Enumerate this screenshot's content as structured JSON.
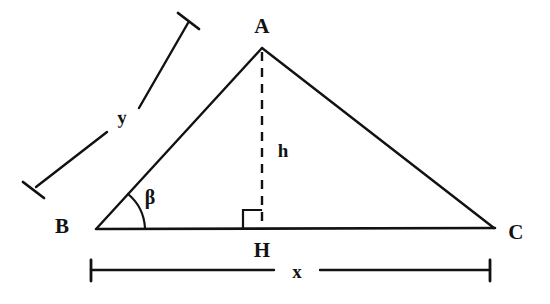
{
  "figure": {
    "background_color": "#ffffff",
    "stroke_color": "#121212",
    "width": 550,
    "height": 304
  },
  "vertices": [
    {
      "name": "A",
      "label": "A",
      "point": {
        "x": 262,
        "y": 48
      },
      "label_pos": {
        "x": 262,
        "y": 26
      }
    },
    {
      "name": "B",
      "label": "B",
      "point": {
        "x": 97,
        "y": 228
      },
      "label_pos": {
        "x": 62,
        "y": 226
      }
    },
    {
      "name": "C",
      "label": "C",
      "point": {
        "x": 494,
        "y": 228
      },
      "label_pos": {
        "x": 516,
        "y": 232
      }
    },
    {
      "name": "H",
      "label": "H",
      "point": {
        "x": 262,
        "y": 228
      },
      "label_pos": {
        "x": 262,
        "y": 250
      }
    }
  ],
  "measures": {
    "height": {
      "label": "h",
      "label_pos": {
        "x": 283,
        "y": 150
      },
      "style": "dashed",
      "from": "A",
      "to": "H"
    },
    "side_y": {
      "label": "y",
      "label_pos": {
        "x": 122,
        "y": 117
      },
      "style": "dimension-line",
      "describes": "BA"
    },
    "base_x": {
      "label": "x",
      "label_pos": {
        "x": 297,
        "y": 271
      },
      "style": "dimension-line",
      "describes": "BC"
    }
  },
  "angle": {
    "label": "β",
    "name": "beta",
    "at_vertex": "B",
    "label_pos": {
      "x": 150,
      "y": 197
    },
    "marker": "arc"
  },
  "markers": {
    "right_angle": {
      "name": "right-angle-square",
      "at_vertex": "H",
      "side": "left"
    }
  }
}
